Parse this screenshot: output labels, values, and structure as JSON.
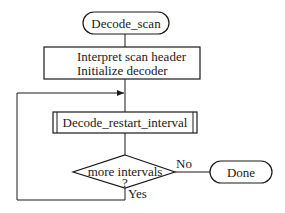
{
  "diagram": {
    "type": "flowchart",
    "nodes": {
      "start": {
        "shape": "terminal",
        "label": "Decode_scan"
      },
      "init": {
        "shape": "process",
        "lines": [
          "Interpret scan header",
          "Initialize decoder"
        ]
      },
      "sub": {
        "shape": "predefined-process",
        "label": "Decode_restart_interval"
      },
      "decision": {
        "shape": "decision",
        "label": "more intervals",
        "suffix": "?"
      },
      "end": {
        "shape": "terminal",
        "label": "Done"
      }
    },
    "edges": {
      "no_label": "No",
      "yes_label": "Yes"
    },
    "colors": {
      "stroke": "#1a1a1a",
      "background": "#ffffff"
    }
  }
}
